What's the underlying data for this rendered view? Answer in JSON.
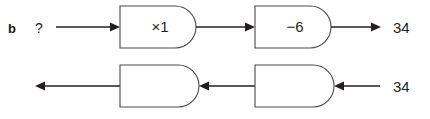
{
  "item": {
    "letter": "b"
  },
  "rows": [
    {
      "name": "top-row",
      "input_label": "?",
      "output_label": "34",
      "machines": [
        {
          "label": "×1"
        },
        {
          "label": "−6"
        }
      ]
    },
    {
      "name": "bottom-row",
      "input_label": "34",
      "output_label": "",
      "machines": [
        {
          "label": ""
        },
        {
          "label": ""
        }
      ]
    }
  ],
  "colors": {
    "ink": "#231f20",
    "box_stroke": "#4a4a4a",
    "paper": "#ffffff"
  }
}
